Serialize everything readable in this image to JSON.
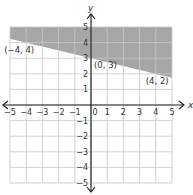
{
  "chart_data": {
    "type": "line",
    "title": "",
    "xlabel": "x",
    "ylabel": "y",
    "xlim": [
      -5,
      5
    ],
    "ylim": [
      -5,
      5
    ],
    "grid": true,
    "x_ticks": [
      -5,
      -4,
      -3,
      -2,
      -1,
      0,
      1,
      2,
      3,
      4,
      5
    ],
    "y_ticks": [
      -5,
      -4,
      -3,
      -2,
      -1,
      1,
      2,
      3,
      4,
      5
    ],
    "x_tick_labels": [
      "−5",
      "−4",
      "−3",
      "−2",
      "−1",
      "0",
      "1",
      "2",
      "3",
      "4",
      "5"
    ],
    "y_tick_labels": [
      "−5",
      "−4",
      "−3",
      "−2",
      "−1",
      "1",
      "2",
      "3",
      "4",
      "5"
    ],
    "boundary_line": {
      "slope": -0.25,
      "intercept": 3,
      "style": "solid"
    },
    "shaded_region": "above",
    "inequality": "y ≥ -1/4 x + 3",
    "points": [
      {
        "x": -4,
        "y": 4,
        "label": "(−4, 4)"
      },
      {
        "x": 0,
        "y": 3,
        "label": "(0, 3)"
      },
      {
        "x": 4,
        "y": 2,
        "label": "(4, 2)"
      }
    ]
  },
  "colors": {
    "shade": "#a6a6a6",
    "grid": "#c8c8c8",
    "axis": "#231f20",
    "text": "#333333"
  },
  "layout": {
    "x0": 10,
    "x1": 172,
    "y0": 27,
    "y1": 183,
    "originX": 92,
    "originY": 105
  }
}
